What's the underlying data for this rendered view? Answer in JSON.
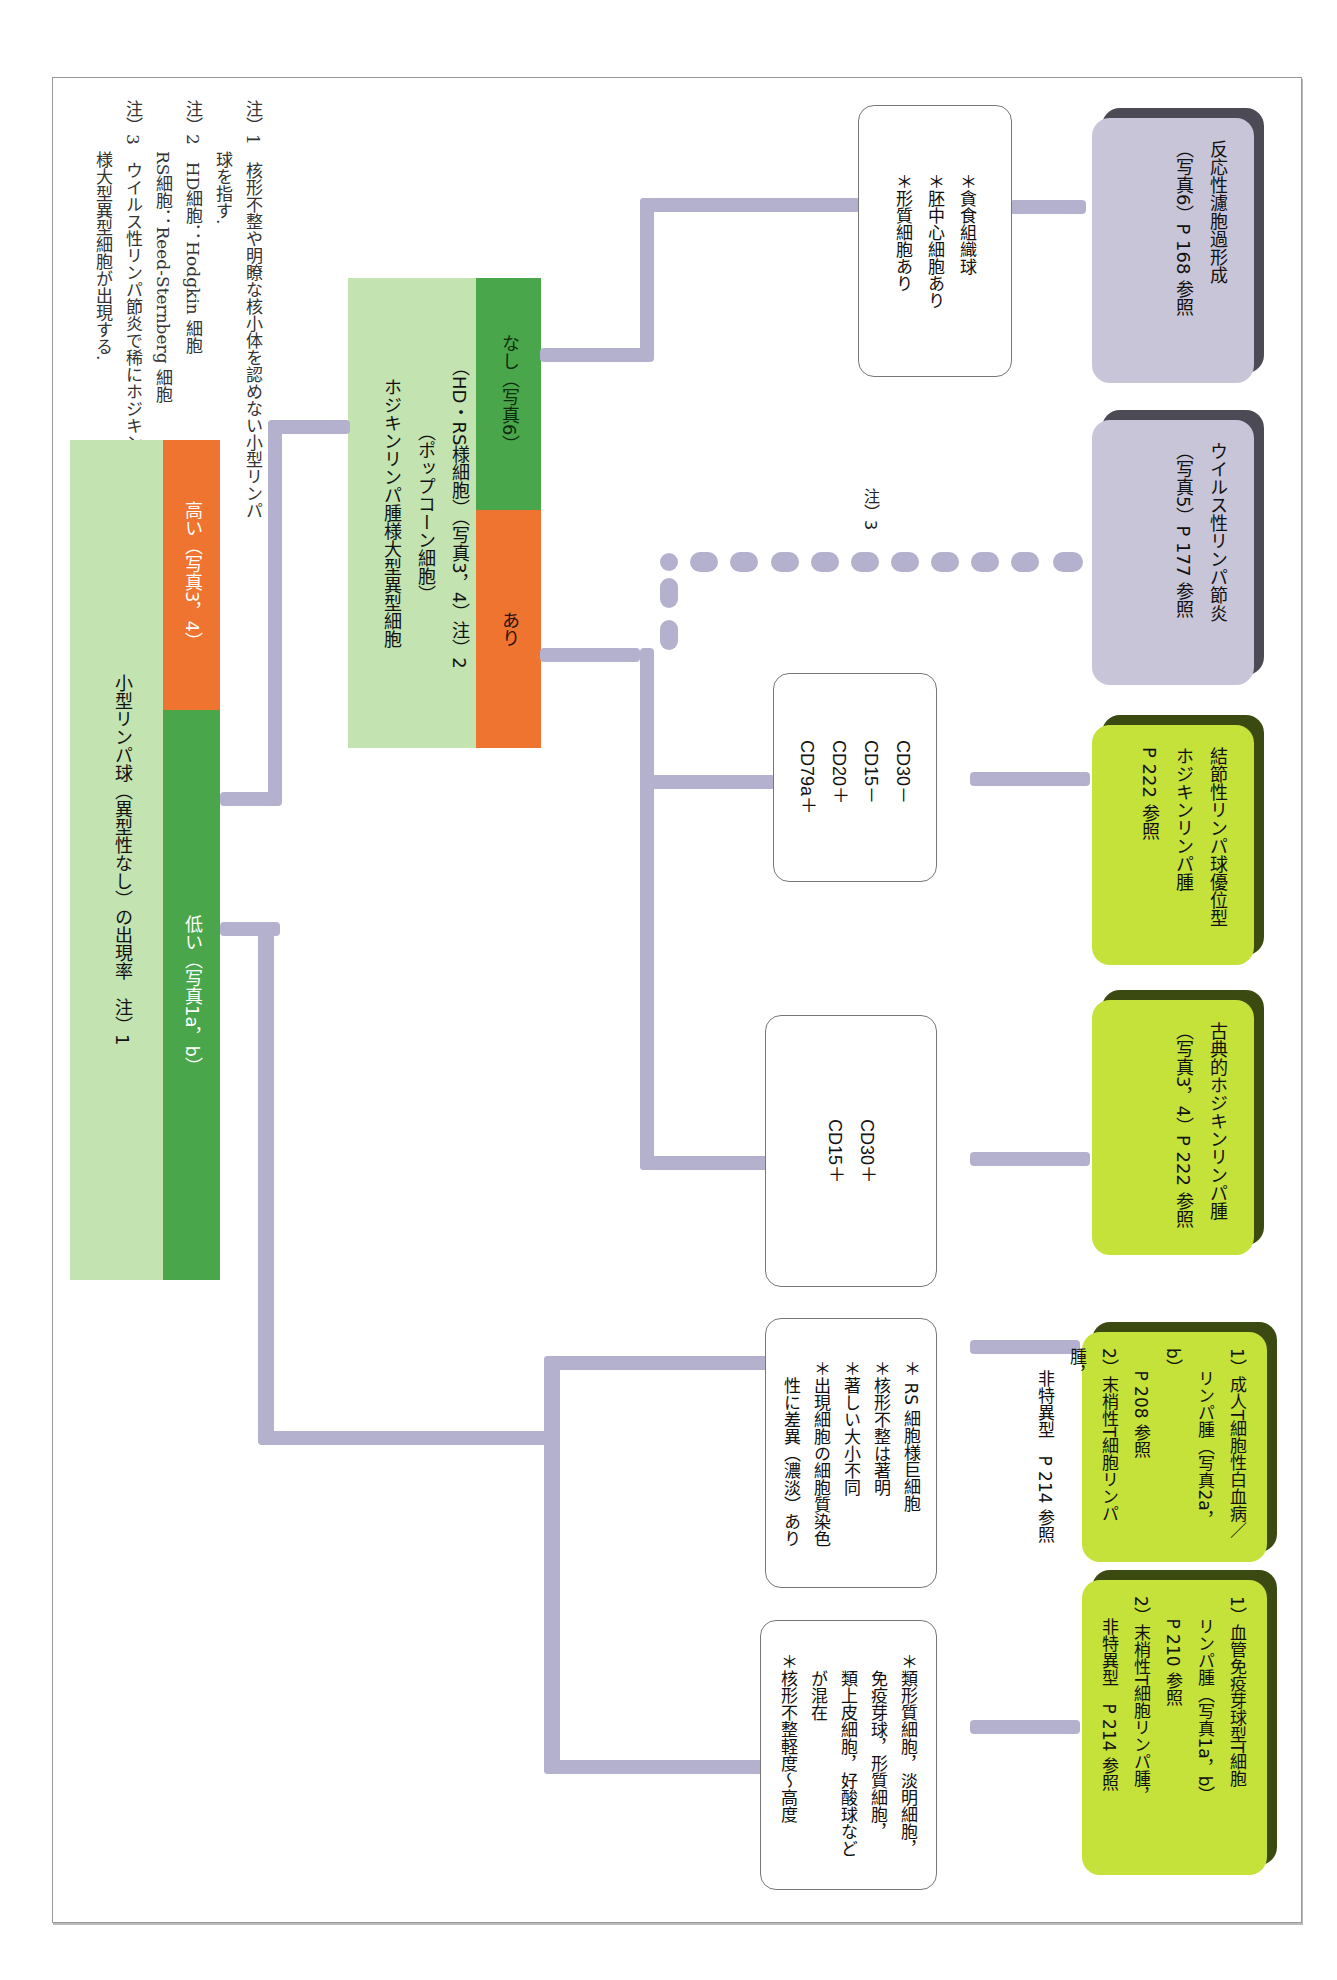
{
  "notes": [
    {
      "label": "注）1",
      "lines": [
        "核形不整や明瞭な核小体を認めない小型リンパ",
        "球を指す."
      ]
    },
    {
      "label": "注）2",
      "lines": [
        "HD細胞：Hodgkin 細胞",
        "RS細胞：Reed-Sternberg 細胞"
      ]
    },
    {
      "label": "注）3",
      "lines": [
        "ウイルス性リンパ節炎で稀にホジキンリンパ腫",
        "様大型異型細胞が出現する."
      ]
    }
  ],
  "root": {
    "title": "小型リンパ球（異型性なし）の出現率　注）1",
    "low": "低い（写真1a，b）",
    "high": "高い（写真3，4）"
  },
  "hodgkin_node": {
    "title_lines": [
      "ホジキンリンパ腫様大型異型細胞",
      "（ポップコーン細胞）",
      "（HD・RS様細胞）（写真3，4）注）2"
    ],
    "yes": "あり",
    "no": "なし（写真6）"
  },
  "note3_label": "注）3",
  "criteria": {
    "reactive": [
      "＊貪食組織球",
      "＊胚中心細胞あり",
      "＊形質細胞あり"
    ],
    "nlphl": [
      "CD30－",
      "CD15－",
      "CD20＋",
      "CD79a＋"
    ],
    "classic": [
      "CD30＋",
      "CD15＋"
    ],
    "atl": [
      "＊ RS 細胞様巨細胞",
      "＊核形不整は著明",
      "＊著しい大小不同",
      "＊出現細胞の細胞質染色",
      "　性に差異（濃淡）あり"
    ],
    "aitl": [
      "＊類形質細胞，淡明細胞，",
      "　免疫芽球，形質細胞，",
      "　類上皮細胞，好酸球など",
      "　が混在",
      "＊核形不整軽度～高度"
    ]
  },
  "results": {
    "reactive": [
      "反応性濾胞過形成",
      "（写真6）P 168 参照"
    ],
    "viral": [
      "ウイルス性リンパ節炎",
      "（写真5）P 177 参照"
    ],
    "nlphl": [
      "結節性リンパ球優位型",
      "ホジキンリンパ腫",
      "P 222 参照"
    ],
    "classic": [
      "古典的ホジキンリンパ腫",
      "（写真3，4）P 222 参照"
    ],
    "atl": [
      "1）成人T細胞性白血病／",
      "　 リンパ腫（写真2a，b）",
      "　 P 208 参照",
      "2）末梢性T細胞リンパ腫，",
      "　 非特異型　P 214 参照"
    ],
    "aitl": [
      "1）血管免疫芽球型T細胞",
      "　 リンパ腫（写真1a，b）",
      "　 P 210 参照",
      "2）末梢性T細胞リンパ腫，",
      "　 非特異型　P 214 参照"
    ]
  },
  "colors": {
    "header_bg": "#c3e3b1",
    "low_green": "#4aa64a",
    "high_orange": "#ee7430",
    "connector": "#b4b1cf",
    "result_gray": "#c8c5d8",
    "result_lime": "#c4e23a"
  }
}
